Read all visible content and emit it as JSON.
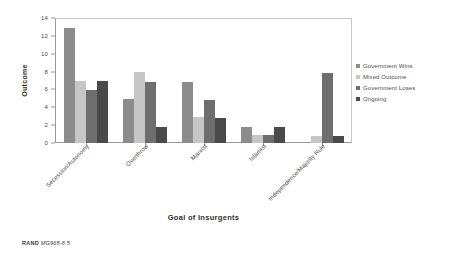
{
  "chart_data": {
    "type": "bar",
    "title": "",
    "xlabel": "Goal of Insurgents",
    "ylabel": "Outcome",
    "ylim": [
      0,
      14
    ],
    "yticks": [
      0,
      2,
      4,
      6,
      8,
      10,
      12,
      14
    ],
    "grid": false,
    "legend_position": "right",
    "categories": [
      "Secession/Autonomy",
      "Overthrow",
      "Marxist",
      "Islamist",
      "Independence/Majority Rule"
    ],
    "series": [
      {
        "name": "Government Wins",
        "color": "#8c8c8c",
        "values": [
          12.9,
          4.9,
          6.8,
          1.8,
          0
        ]
      },
      {
        "name": "Mixed Outcome",
        "color": "#c6c6c6",
        "values": [
          7.0,
          7.9,
          2.9,
          0.9,
          0.8
        ]
      },
      {
        "name": "Government Loses",
        "color": "#6e6e6e",
        "values": [
          5.9,
          6.8,
          4.8,
          0.9,
          7.8
        ]
      },
      {
        "name": "Ongoing",
        "color": "#4a4a4a",
        "values": [
          6.9,
          1.8,
          2.8,
          1.8,
          0.8
        ]
      }
    ]
  },
  "footer": {
    "brand": "RAND",
    "code": "MG965-8.5"
  }
}
